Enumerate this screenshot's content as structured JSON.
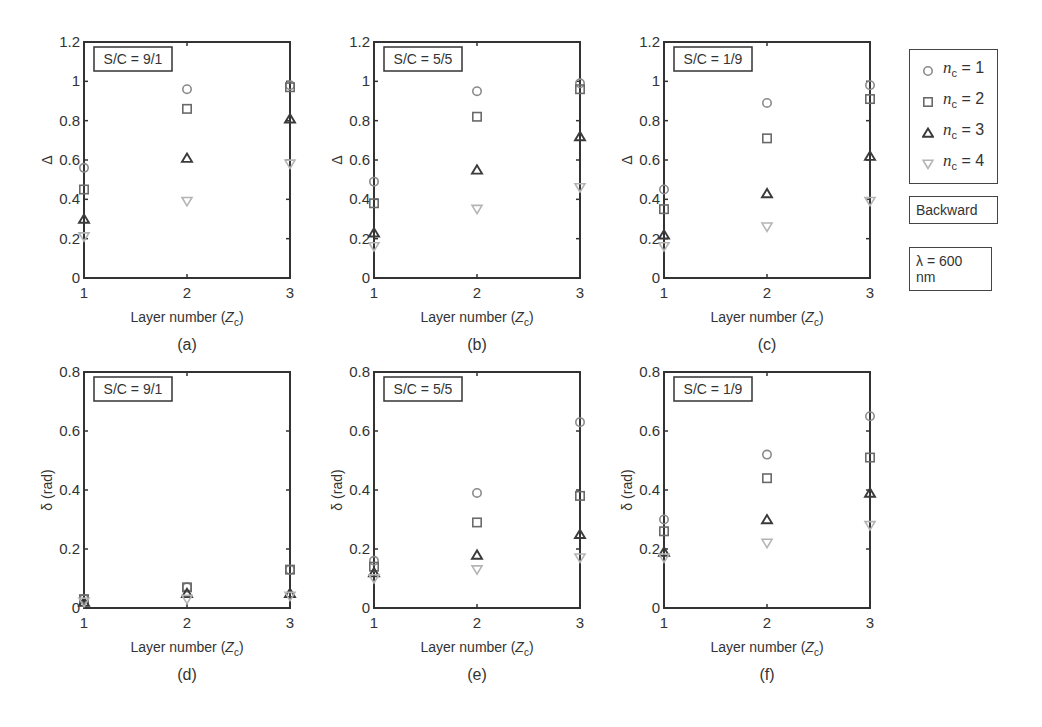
{
  "chart_data": [
    {
      "id": "a",
      "type": "scatter",
      "caption": "(a)",
      "annotation": "S/C = 9/1",
      "xlabel": "Layer number (Z_c)",
      "ylabel": "Δ",
      "x": [
        1,
        2,
        3
      ],
      "xticks": [
        "1",
        "2",
        "3"
      ],
      "ylim": [
        0,
        1.2
      ],
      "yticks": [
        "0",
        "0.2",
        "0.4",
        "0.6",
        "0.8",
        "1",
        "1.2"
      ],
      "series": [
        {
          "name": "n_c = 1",
          "marker": "circle",
          "values": [
            0.56,
            0.96,
            0.98
          ]
        },
        {
          "name": "n_c = 2",
          "marker": "square",
          "values": [
            0.45,
            0.86,
            0.97
          ]
        },
        {
          "name": "n_c = 3",
          "marker": "triangle-up",
          "values": [
            0.3,
            0.61,
            0.81
          ]
        },
        {
          "name": "n_c = 4",
          "marker": "triangle-down",
          "values": [
            0.21,
            0.39,
            0.58
          ]
        }
      ]
    },
    {
      "id": "b",
      "type": "scatter",
      "caption": "(b)",
      "annotation": "S/C = 5/5",
      "xlabel": "Layer number (Z_c)",
      "ylabel": "Δ",
      "x": [
        1,
        2,
        3
      ],
      "xticks": [
        "1",
        "2",
        "3"
      ],
      "ylim": [
        0,
        1.2
      ],
      "yticks": [
        "0",
        "0.2",
        "0.4",
        "0.6",
        "0.8",
        "1",
        "1.2"
      ],
      "series": [
        {
          "name": "n_c = 1",
          "marker": "circle",
          "values": [
            0.49,
            0.95,
            0.99
          ]
        },
        {
          "name": "n_c = 2",
          "marker": "square",
          "values": [
            0.38,
            0.82,
            0.96
          ]
        },
        {
          "name": "n_c = 3",
          "marker": "triangle-up",
          "values": [
            0.23,
            0.55,
            0.72
          ]
        },
        {
          "name": "n_c = 4",
          "marker": "triangle-down",
          "values": [
            0.16,
            0.35,
            0.46
          ]
        }
      ]
    },
    {
      "id": "c",
      "type": "scatter",
      "caption": "(c)",
      "annotation": "S/C = 1/9",
      "xlabel": "Layer number (Z_c)",
      "ylabel": "Δ",
      "x": [
        1,
        2,
        3
      ],
      "xticks": [
        "1",
        "2",
        "3"
      ],
      "ylim": [
        0,
        1.2
      ],
      "yticks": [
        "0",
        "0.2",
        "0.4",
        "0.6",
        "0.8",
        "1",
        "1.2"
      ],
      "series": [
        {
          "name": "n_c = 1",
          "marker": "circle",
          "values": [
            0.45,
            0.89,
            0.98
          ]
        },
        {
          "name": "n_c = 2",
          "marker": "square",
          "values": [
            0.35,
            0.71,
            0.91
          ]
        },
        {
          "name": "n_c = 3",
          "marker": "triangle-up",
          "values": [
            0.22,
            0.43,
            0.62
          ]
        },
        {
          "name": "n_c = 4",
          "marker": "triangle-down",
          "values": [
            0.16,
            0.26,
            0.39
          ]
        }
      ]
    },
    {
      "id": "d",
      "type": "scatter",
      "caption": "(d)",
      "annotation": "S/C = 9/1",
      "xlabel": "Layer number (Z_c)",
      "ylabel": "δ (rad)",
      "x": [
        1,
        2,
        3
      ],
      "xticks": [
        "1",
        "2",
        "3"
      ],
      "ylim": [
        0,
        0.8
      ],
      "yticks": [
        "0",
        "0.2",
        "0.4",
        "0.6",
        "0.8"
      ],
      "series": [
        {
          "name": "n_c = 1",
          "marker": "circle",
          "values": [
            0.03,
            0.07,
            0.13
          ]
        },
        {
          "name": "n_c = 2",
          "marker": "square",
          "values": [
            0.03,
            0.07,
            0.13
          ]
        },
        {
          "name": "n_c = 3",
          "marker": "triangle-up",
          "values": [
            0.02,
            0.05,
            0.05
          ]
        },
        {
          "name": "n_c = 4",
          "marker": "triangle-down",
          "values": [
            0.02,
            0.03,
            0.04
          ]
        }
      ]
    },
    {
      "id": "e",
      "type": "scatter",
      "caption": "(e)",
      "annotation": "S/C = 5/5",
      "xlabel": "Layer number (Z_c)",
      "ylabel": "δ (rad)",
      "x": [
        1,
        2,
        3
      ],
      "xticks": [
        "1",
        "2",
        "3"
      ],
      "ylim": [
        0,
        0.8
      ],
      "yticks": [
        "0",
        "0.2",
        "0.4",
        "0.6",
        "0.8"
      ],
      "series": [
        {
          "name": "n_c = 1",
          "marker": "circle",
          "values": [
            0.16,
            0.39,
            0.63
          ]
        },
        {
          "name": "n_c = 2",
          "marker": "square",
          "values": [
            0.14,
            0.29,
            0.38
          ]
        },
        {
          "name": "n_c = 3",
          "marker": "triangle-up",
          "values": [
            0.12,
            0.18,
            0.25
          ]
        },
        {
          "name": "n_c = 4",
          "marker": "triangle-down",
          "values": [
            0.1,
            0.13,
            0.17
          ]
        }
      ]
    },
    {
      "id": "f",
      "type": "scatter",
      "caption": "(f)",
      "annotation": "S/C = 1/9",
      "xlabel": "Layer number (Z_c)",
      "ylabel": "δ (rad)",
      "x": [
        1,
        2,
        3
      ],
      "xticks": [
        "1",
        "2",
        "3"
      ],
      "ylim": [
        0,
        0.8
      ],
      "yticks": [
        "0",
        "0.2",
        "0.4",
        "0.6",
        "0.8"
      ],
      "series": [
        {
          "name": "n_c = 1",
          "marker": "circle",
          "values": [
            0.3,
            0.52,
            0.65
          ]
        },
        {
          "name": "n_c = 2",
          "marker": "square",
          "values": [
            0.26,
            0.44,
            0.51
          ]
        },
        {
          "name": "n_c = 3",
          "marker": "triangle-up",
          "values": [
            0.19,
            0.3,
            0.39
          ]
        },
        {
          "name": "n_c = 4",
          "marker": "triangle-down",
          "values": [
            0.17,
            0.22,
            0.28
          ]
        }
      ]
    }
  ],
  "legend": {
    "entries": [
      {
        "marker": "circle",
        "symbol": "n",
        "sub": "c",
        "value": "= 1"
      },
      {
        "marker": "square",
        "symbol": "n",
        "sub": "c",
        "value": "= 2"
      },
      {
        "marker": "triangle-up",
        "symbol": "n",
        "sub": "c",
        "value": "= 3"
      },
      {
        "marker": "triangle-down",
        "symbol": "n",
        "sub": "c",
        "value": "= 4"
      }
    ],
    "direction_label": "Backward",
    "wavelength_label": "λ = 600 nm"
  },
  "colors": {
    "circle": "#8a8a8a",
    "square": "#6a6a6a",
    "triangle-up": "#3a3a3a",
    "triangle-down": "#b4b4b4",
    "axis": "#333333"
  }
}
